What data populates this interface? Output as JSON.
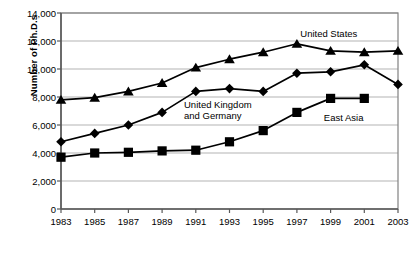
{
  "chart_data": {
    "type": "line",
    "title": "",
    "xlabel": "",
    "ylabel": "Number of Ph.D.s",
    "xlim": [
      1983,
      2003
    ],
    "ylim": [
      0,
      14000
    ],
    "grid": true,
    "legend_position": "inline-annotations",
    "x": [
      1983,
      1985,
      1987,
      1989,
      1991,
      1993,
      1995,
      1997,
      1999,
      2001,
      2003
    ],
    "xticklabels": [
      "1983",
      "1985",
      "1987",
      "1989",
      "1991",
      "1993",
      "1995",
      "1997",
      "1999",
      "2001",
      "2003"
    ],
    "yticks": [
      0,
      2000,
      4000,
      6000,
      8000,
      10000,
      12000,
      14000
    ],
    "yticklabels": [
      "0",
      "2,000",
      "4,000",
      "6,000",
      "8,000",
      "10,000",
      "12,000",
      "14,000"
    ],
    "series": [
      {
        "name": "United States",
        "marker": "triangle",
        "color": "#000000",
        "x": [
          1983,
          1985,
          1987,
          1989,
          1991,
          1993,
          1995,
          1997,
          1999,
          2001,
          2003
        ],
        "values": [
          7800,
          7950,
          8400,
          9000,
          10100,
          10700,
          11200,
          11800,
          11300,
          11200,
          11300
        ],
        "label_text": "United States",
        "label_x": 1997.2,
        "label_y": 12500
      },
      {
        "name": "United Kingdom and Germany",
        "marker": "diamond",
        "color": "#000000",
        "x": [
          1983,
          1985,
          1987,
          1989,
          1991,
          1993,
          1995,
          1997,
          1999,
          2001,
          2003
        ],
        "values": [
          4800,
          5400,
          6000,
          6900,
          8400,
          8600,
          8400,
          9700,
          9800,
          10300,
          8900
        ],
        "label_text": "United Kingdom\nand Germany",
        "label_x": 1990.3,
        "label_y": 7450
      },
      {
        "name": "East Asia",
        "marker": "square",
        "color": "#000000",
        "x": [
          1983,
          1985,
          1987,
          1989,
          1991,
          1993,
          1995,
          1997,
          1999,
          2001
        ],
        "values": [
          3700,
          4000,
          4050,
          4150,
          4200,
          4800,
          5600,
          6900,
          7900,
          7900
        ],
        "label_text": "East Asia",
        "label_x": 1998.6,
        "label_y": 6500
      }
    ]
  },
  "style": {
    "plot_border_color": "#808080",
    "gridline_color": "#b3b3b3",
    "line_color": "#000000",
    "background": "#ffffff"
  }
}
